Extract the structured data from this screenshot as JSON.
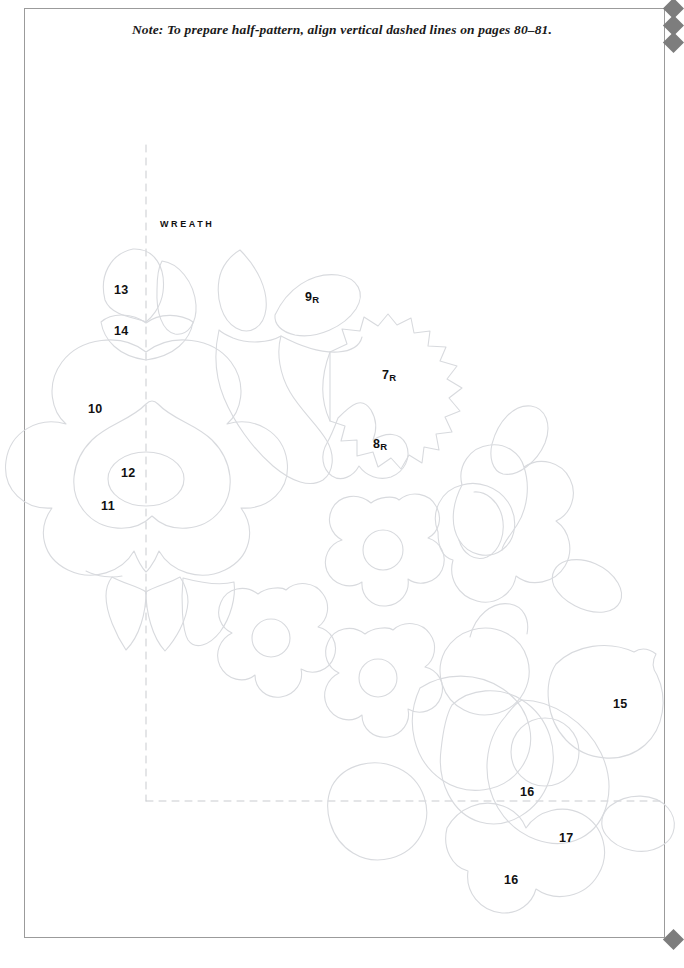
{
  "page": {
    "width": 684,
    "height": 968,
    "background_color": "#ffffff",
    "frame_color": "#9b9b9b"
  },
  "note": {
    "text": "Note: To prepare half-pattern, align vertical dashed lines on pages 80–81."
  },
  "pattern": {
    "title_label": "WREATH",
    "line_color": "#d8dade",
    "dash_color": "#c9cbcf",
    "label_color": "#111111",
    "registration_marks": {
      "color": "#7d7d7d",
      "top_right_count": 3,
      "bottom_right_count": 1
    },
    "guides": {
      "vertical_dashed_line": {
        "x": 146,
        "y1": 145,
        "y2": 801
      },
      "horizontal_dashed_line": {
        "y": 801,
        "x1": 146,
        "x2": 663
      }
    },
    "piece_labels": [
      {
        "id": "label-13",
        "text": "13",
        "reversed": false,
        "x": 114,
        "y": 284
      },
      {
        "id": "label-14",
        "text": "14",
        "reversed": false,
        "x": 114,
        "y": 325
      },
      {
        "id": "label-9r",
        "text": "9",
        "reversed": true,
        "x": 305,
        "y": 291
      },
      {
        "id": "label-10",
        "text": "10",
        "reversed": false,
        "x": 88,
        "y": 403
      },
      {
        "id": "label-7r",
        "text": "7",
        "reversed": true,
        "x": 382,
        "y": 369
      },
      {
        "id": "label-8r",
        "text": "8",
        "reversed": true,
        "x": 373,
        "y": 438
      },
      {
        "id": "label-12",
        "text": "12",
        "reversed": false,
        "x": 121,
        "y": 467
      },
      {
        "id": "label-11",
        "text": "11",
        "reversed": false,
        "x": 101,
        "y": 500
      },
      {
        "id": "label-15",
        "text": "15",
        "reversed": false,
        "x": 613,
        "y": 698
      },
      {
        "id": "label-16a",
        "text": "16",
        "reversed": false,
        "x": 520,
        "y": 786
      },
      {
        "id": "label-17",
        "text": "17",
        "reversed": false,
        "x": 559,
        "y": 832
      },
      {
        "id": "label-16b",
        "text": "16",
        "reversed": false,
        "x": 504,
        "y": 874
      }
    ]
  }
}
